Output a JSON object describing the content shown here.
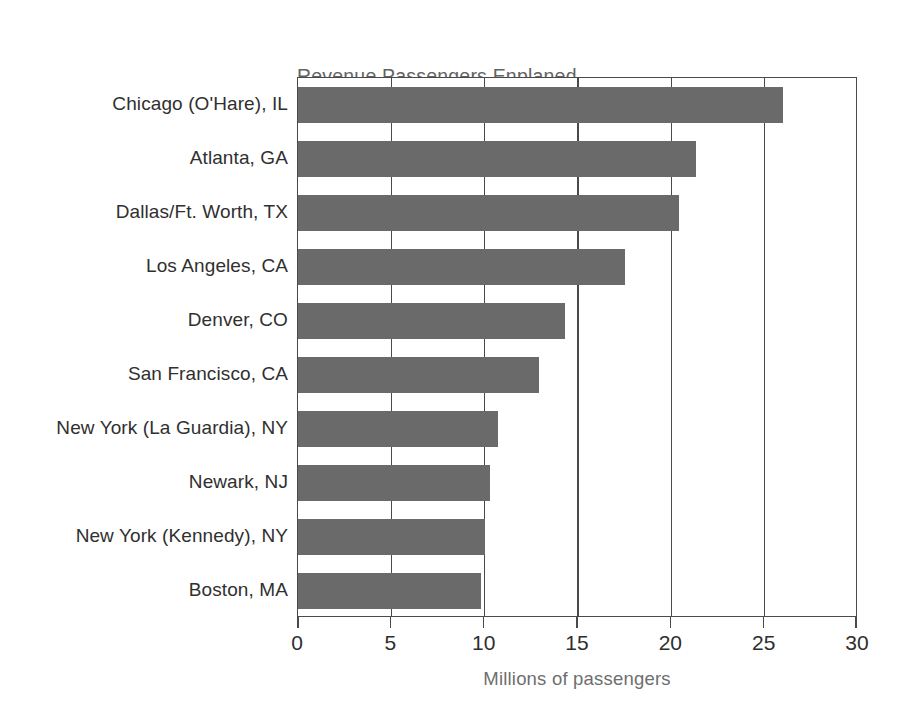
{
  "chart_data": {
    "type": "bar",
    "orientation": "horizontal",
    "title": "Revenue Passengers Enplaned—\nTop 10 Airports: 1988",
    "title_lines": [
      "Revenue Passengers Enplaned—",
      "Top 10 Airports: 1988"
    ],
    "subtitle": "",
    "xlabel": "Millions of passengers",
    "ylabel": "",
    "xlim": [
      0,
      30
    ],
    "xticks": [
      0,
      5,
      10,
      15,
      20,
      25,
      30
    ],
    "xtick_labels": [
      "0",
      "5",
      "10",
      "15",
      "20",
      "25",
      "30"
    ],
    "grid": true,
    "gridlines_axis": "x",
    "legend": null,
    "bar_color": "#6a6a6a",
    "axis_color": "#4a4a4a",
    "title_color": "#636363",
    "label_color": "#303030",
    "categories": [
      "Chicago (O'Hare), IL",
      "Atlanta, GA",
      "Dallas/Ft. Worth, TX",
      "Los Angeles, CA",
      "Denver, CO",
      "San Francisco, CA",
      "New York (La Guardia), NY",
      "Newark, NJ",
      "New York (Kennedy), NY",
      "Boston, MA"
    ],
    "values": [
      26.0,
      21.3,
      20.4,
      17.5,
      14.3,
      12.9,
      10.7,
      10.3,
      10.0,
      9.8
    ],
    "units": "millions of passengers"
  }
}
